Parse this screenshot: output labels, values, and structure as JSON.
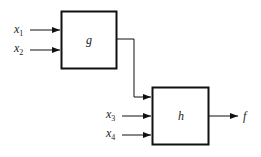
{
  "blocks": {
    "g": {
      "label": "g"
    },
    "h": {
      "label": "h"
    }
  },
  "inputs": {
    "x1": {
      "base": "x",
      "sub": "1"
    },
    "x2": {
      "base": "x",
      "sub": "2"
    },
    "x3": {
      "base": "x",
      "sub": "3"
    },
    "x4": {
      "base": "x",
      "sub": "4"
    }
  },
  "output": {
    "label": "f"
  },
  "colors": {
    "stroke": "#111111",
    "background": "#ffffff"
  }
}
